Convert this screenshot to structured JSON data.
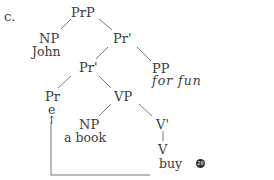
{
  "example_label": "c.",
  "tree": {
    "root": {
      "label": "PrP"
    },
    "subject": {
      "label": "NP",
      "text": "John"
    },
    "pr_bar_upper": {
      "label": "Pr'"
    },
    "pr_bar_lower": {
      "label": "Pr'"
    },
    "adjunct": {
      "label": "PP",
      "text": "for fun"
    },
    "pr_head": {
      "label": "Pr",
      "text": "e",
      "arrow": "↑"
    },
    "vp": {
      "label": "VP"
    },
    "object": {
      "label": "NP",
      "text": "a book"
    },
    "v_bar": {
      "label": "V'"
    },
    "v_head": {
      "label": "V",
      "text": "buy"
    }
  },
  "marker": {
    "text": "28"
  }
}
